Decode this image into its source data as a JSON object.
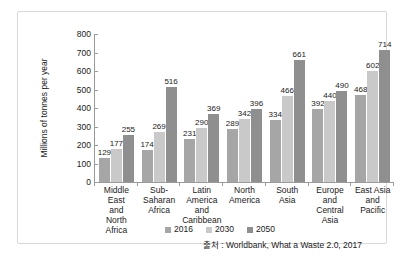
{
  "chart_data": {
    "type": "bar",
    "title": "",
    "xlabel": "",
    "ylabel": "Millions of tonnes per year",
    "ylim": [
      0,
      800
    ],
    "yticks": [
      0,
      100,
      200,
      300,
      400,
      500,
      600,
      700,
      800
    ],
    "grid": false,
    "legend_position": "bottom-center",
    "categories": [
      "Middle East and North Africa",
      "Sub-Saharan Africa",
      "Latin America and Caribbean",
      "North America",
      "South Asia",
      "Europe and Central Asia",
      "East Asia and Pacific"
    ],
    "category_lines": [
      [
        "Middle East",
        "and",
        "North Africa"
      ],
      [
        "Sub-",
        "Saharan",
        "Africa"
      ],
      [
        "Latin",
        "America and",
        "Caribbean"
      ],
      [
        "North",
        "America"
      ],
      [
        "South",
        "Asia"
      ],
      [
        "Europe and",
        "Central Asia"
      ],
      [
        "East Asia",
        "and",
        "Pacific"
      ]
    ],
    "series": [
      {
        "name": "2016",
        "color": "#a6a6a6",
        "values": [
          129,
          174,
          231,
          289,
          334,
          392,
          468
        ]
      },
      {
        "name": "2030",
        "color": "#c9c9c9",
        "values": [
          177,
          269,
          290,
          342,
          466,
          440,
          602
        ]
      },
      {
        "name": "2050",
        "color": "#8f8f8f",
        "values": [
          255,
          516,
          369,
          396,
          661,
          490,
          714
        ]
      }
    ]
  },
  "legend": {
    "items": [
      {
        "label": "2016",
        "color": "#a6a6a6"
      },
      {
        "label": "2030",
        "color": "#c9c9c9"
      },
      {
        "label": "2050",
        "color": "#8f8f8f"
      }
    ]
  },
  "source": {
    "text": "출처 : Worldbank, What a Waste 2.0, 2017"
  }
}
